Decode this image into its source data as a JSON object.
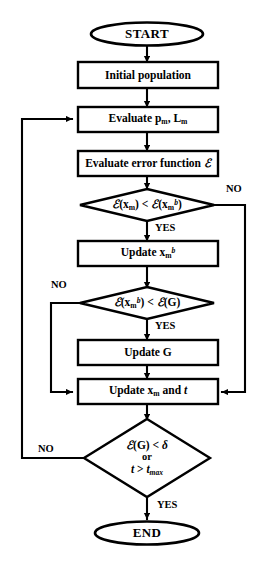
{
  "diagram": {
    "type": "flowchart",
    "stroke_color": "#000000",
    "fill_color": "#ffffff",
    "background_color": "#ffffff",
    "nodes": [
      {
        "id": "start",
        "shape": "terminal",
        "label": "START"
      },
      {
        "id": "init",
        "shape": "process",
        "label": "Initial population"
      },
      {
        "id": "eval_pl",
        "shape": "process",
        "label": "Evaluate p_m, L_m"
      },
      {
        "id": "eval_err",
        "shape": "process",
        "label": "Evaluate error function E"
      },
      {
        "id": "cmp_local",
        "shape": "decision",
        "label": "E(x_m) < E(x_m^b)"
      },
      {
        "id": "update_xb",
        "shape": "process",
        "label": "Update x_m^b"
      },
      {
        "id": "cmp_global",
        "shape": "decision",
        "label": "E(x_m^b) < E(G)"
      },
      {
        "id": "update_g",
        "shape": "process",
        "label": "Update G"
      },
      {
        "id": "update_x_t",
        "shape": "process",
        "label": "Update x_m and t"
      },
      {
        "id": "stop_test",
        "shape": "decision",
        "label": "E(G) < d  or  t > t_max"
      },
      {
        "id": "end",
        "shape": "terminal",
        "label": "END"
      }
    ],
    "edge_labels": {
      "local_no": "NO",
      "local_yes": "YES",
      "global_no": "NO",
      "global_yes": "YES",
      "stop_no": "NO",
      "stop_yes": "YES"
    },
    "edges": [
      {
        "from": "start",
        "to": "init"
      },
      {
        "from": "init",
        "to": "eval_pl"
      },
      {
        "from": "eval_pl",
        "to": "eval_err"
      },
      {
        "from": "eval_err",
        "to": "cmp_local"
      },
      {
        "from": "cmp_local",
        "to": "update_xb",
        "label": "YES"
      },
      {
        "from": "cmp_local",
        "to": "update_x_t",
        "label": "NO"
      },
      {
        "from": "update_xb",
        "to": "cmp_global"
      },
      {
        "from": "cmp_global",
        "to": "update_g",
        "label": "YES"
      },
      {
        "from": "cmp_global",
        "to": "update_x_t",
        "label": "NO"
      },
      {
        "from": "update_g",
        "to": "update_x_t"
      },
      {
        "from": "update_x_t",
        "to": "stop_test"
      },
      {
        "from": "stop_test",
        "to": "eval_pl",
        "label": "NO"
      },
      {
        "from": "stop_test",
        "to": "end",
        "label": "YES"
      }
    ]
  }
}
